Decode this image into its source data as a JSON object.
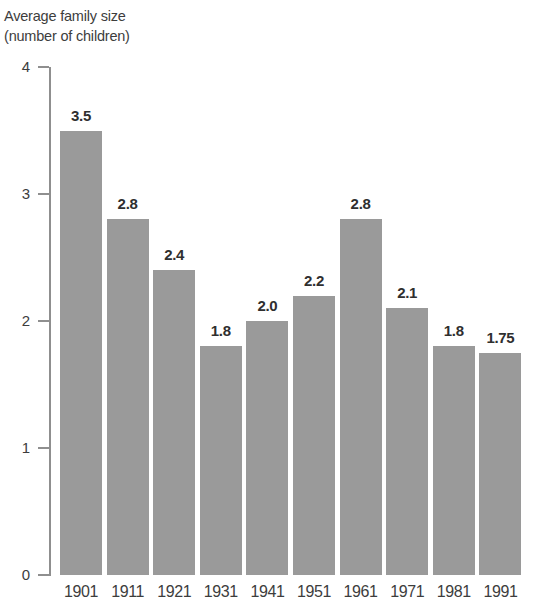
{
  "chart_data": {
    "type": "bar",
    "title": "Average family size (number of children)",
    "title_lines": [
      "Average family size",
      "(number of children)"
    ],
    "xlabel": "",
    "ylabel": "Average family size (number of children)",
    "categories": [
      "1901",
      "1911",
      "1921",
      "1931",
      "1941",
      "1951",
      "1961",
      "1971",
      "1981",
      "1991"
    ],
    "values": [
      3.5,
      2.8,
      2.4,
      1.8,
      2.0,
      2.2,
      2.8,
      2.1,
      1.8,
      1.75
    ],
    "value_labels": [
      "3.5",
      "2.8",
      "2.4",
      "1.8",
      "2.0",
      "2.2",
      "2.8",
      "2.1",
      "1.8",
      "1.75"
    ],
    "ylim": [
      0,
      4
    ],
    "y_ticks": [
      0,
      1,
      2,
      3,
      4
    ],
    "y_tick_labels": [
      "0",
      "1",
      "2",
      "3",
      "4"
    ],
    "grid": false,
    "legend": null,
    "bar_color": "#9a9a9a",
    "axis_color": "#8f8f8f",
    "text_color": "#3d3d3d",
    "background_color": "#ffffff"
  }
}
